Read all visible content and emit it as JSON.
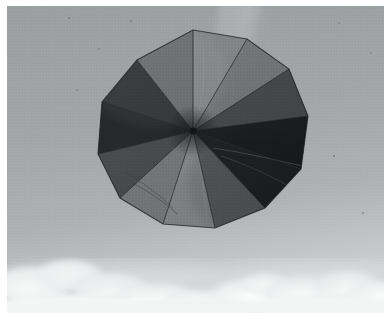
{
  "image": {
    "title": "Multicolored panel parachute kite flying against a hazy sky",
    "subject": "kite",
    "width": 391,
    "height": 319,
    "border": {
      "color": "#ffffff",
      "left": 7,
      "top": 6,
      "right": 7,
      "bottom": 6
    }
  },
  "sky": {
    "name": "hazy-overcast-sky",
    "top_color": "#9ea2a4",
    "mid_color": "#a2a6a8",
    "bottom_color": "#c9cdcf",
    "haze_streak": {
      "name": "light-diagonal-streak",
      "color": "#b4b8b9",
      "description": "faint pale diagonal band descending from top edge toward the kite"
    },
    "specks": [
      {
        "x": 62,
        "y": 12,
        "r": 1.1,
        "color": "#6f7274"
      },
      {
        "x": 124,
        "y": 15,
        "r": 1.0,
        "color": "#73767a"
      },
      {
        "x": 92,
        "y": 43,
        "r": 1.0,
        "color": "#75787b"
      },
      {
        "x": 70,
        "y": 84,
        "r": 0.9,
        "color": "#787b7e"
      },
      {
        "x": 332,
        "y": 17,
        "r": 1.0,
        "color": "#76797c"
      },
      {
        "x": 327,
        "y": 150,
        "r": 1.1,
        "color": "#6e7174"
      },
      {
        "x": 364,
        "y": 47,
        "r": 0.9,
        "color": "#7a7d80"
      },
      {
        "x": 356,
        "y": 207,
        "r": 1.0,
        "color": "#787b7d"
      },
      {
        "x": 311,
        "y": 283,
        "r": 1.0,
        "color": "#8b8e90"
      },
      {
        "x": 193,
        "y": 300,
        "r": 0.9,
        "color": "#a5a8aa"
      },
      {
        "x": 160,
        "y": 307,
        "r": 0.8,
        "color": "#a9acae"
      }
    ]
  },
  "clouds": {
    "name": "cumulus-cloud-band",
    "base_color": "#f2f4f4",
    "shadow_color": "#cdd1d2",
    "band_top": 246,
    "puffs": [
      {
        "cx": 24,
        "cy": 278,
        "rx": 42,
        "ry": 20,
        "color": "#f4f6f6"
      },
      {
        "cx": 62,
        "cy": 268,
        "rx": 34,
        "ry": 16,
        "color": "#eef1f1"
      },
      {
        "cx": 104,
        "cy": 283,
        "rx": 40,
        "ry": 18,
        "color": "#f3f5f5"
      },
      {
        "cx": 150,
        "cy": 292,
        "rx": 46,
        "ry": 17,
        "color": "#eff2f2"
      },
      {
        "cx": 196,
        "cy": 296,
        "rx": 40,
        "ry": 14,
        "color": "#e9eced"
      },
      {
        "cx": 244,
        "cy": 288,
        "rx": 44,
        "ry": 18,
        "color": "#f1f3f3"
      },
      {
        "cx": 258,
        "cy": 277,
        "rx": 26,
        "ry": 11,
        "color": "#eceeef"
      },
      {
        "cx": 296,
        "cy": 286,
        "rx": 38,
        "ry": 18,
        "color": "#f3f5f5"
      },
      {
        "cx": 340,
        "cy": 280,
        "rx": 34,
        "ry": 17,
        "color": "#f5f7f7"
      },
      {
        "cx": 372,
        "cy": 290,
        "rx": 32,
        "ry": 18,
        "color": "#f4f6f6"
      },
      {
        "cx": 186,
        "cy": 303,
        "rx": 60,
        "ry": 14,
        "color": "#f2f4f4"
      },
      {
        "cx": 60,
        "cy": 302,
        "rx": 70,
        "ry": 14,
        "color": "#f4f6f6"
      },
      {
        "cx": 320,
        "cy": 303,
        "rx": 70,
        "ry": 14,
        "color": "#f3f5f5"
      }
    ]
  },
  "kite": {
    "name": "twelve-panel-parachute-kite",
    "shape": "dodecagon",
    "panel_count": 12,
    "center": {
      "x": 186,
      "y": 125
    },
    "radius_x": 107,
    "radius_y": 101,
    "rotation_deg": -8,
    "outline_color": "#1b1c1d",
    "hub_color": "#141516",
    "panels": [
      {
        "index": 0,
        "name": "panel-top-left-light-gray",
        "color": "#5f6164",
        "shade": "#55575a"
      },
      {
        "index": 1,
        "name": "panel-top-pale-gray",
        "color": "#7c7f82",
        "shade": "#73767a"
      },
      {
        "index": 2,
        "name": "panel-top-right-medium-gray",
        "color": "#6b6e71",
        "shade": "#5f6265"
      },
      {
        "index": 3,
        "name": "panel-upper-right-dark",
        "color": "#3a3c3e",
        "shade": "#2f3133"
      },
      {
        "index": 4,
        "name": "panel-right-black",
        "color": "#0d0e10",
        "shade": "#08090a"
      },
      {
        "index": 5,
        "name": "panel-lower-right-black",
        "color": "#121315",
        "shade": "#0a0b0c"
      },
      {
        "index": 6,
        "name": "panel-bottom-right-gray",
        "color": "#505255",
        "shade": "#46484b"
      },
      {
        "index": 7,
        "name": "panel-bottom-pale-gray",
        "color": "#7e8184",
        "shade": "#75787b"
      },
      {
        "index": 8,
        "name": "panel-bottom-left-light",
        "color": "#6e7174",
        "shade": "#65686b"
      },
      {
        "index": 9,
        "name": "panel-left-dark-gray",
        "color": "#3c3e41",
        "shade": "#333537"
      },
      {
        "index": 10,
        "name": "panel-upper-left-black",
        "color": "#141618",
        "shade": "#0d0e10"
      },
      {
        "index": 11,
        "name": "panel-top-left-dark",
        "color": "#1f2123",
        "shade": "#17191b"
      }
    ],
    "creases": [
      {
        "name": "crease-right-diagonal",
        "color": "#4a4c4e"
      },
      {
        "name": "crease-lower-left",
        "color": "#3b3d3f"
      },
      {
        "name": "crease-top-center",
        "color": "#8a8d90"
      }
    ]
  }
}
